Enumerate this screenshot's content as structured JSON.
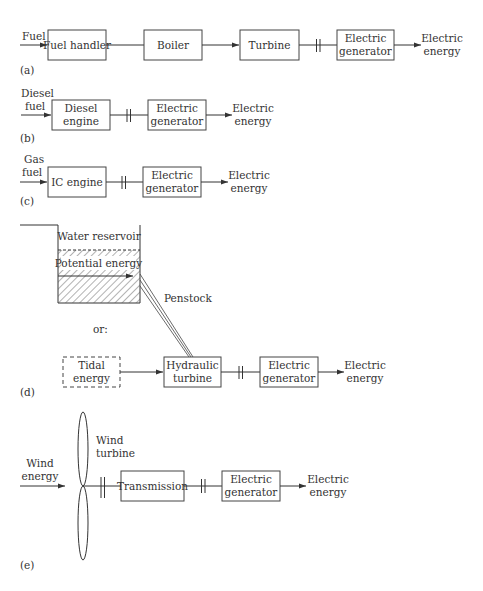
{
  "colors": {
    "stroke": "#444444",
    "text": "#333333",
    "background": "#ffffff"
  },
  "panel_a": {
    "caption": "(a)",
    "input": "Fuel",
    "blocks": [
      "Fuel handler",
      "Boiler",
      "Turbine"
    ],
    "generator": [
      "Electric",
      "generator"
    ],
    "output": [
      "Electric",
      "energy"
    ]
  },
  "panel_b": {
    "caption": "(b)",
    "input": [
      "Diesel",
      "fuel"
    ],
    "engine": [
      "Diesel",
      "engine"
    ],
    "generator": [
      "Electric",
      "generator"
    ],
    "output": [
      "Electric",
      "energy"
    ]
  },
  "panel_c": {
    "caption": "(c)",
    "input": [
      "Gas",
      "fuel"
    ],
    "engine": "IC engine",
    "generator": [
      "Electric",
      "generator"
    ],
    "output": [
      "Electric",
      "energy"
    ]
  },
  "panel_d": {
    "caption": "(d)",
    "reservoir": "Water reservoir",
    "potential": "Potential energy",
    "penstock": "Penstock",
    "or": "or:",
    "tidal": [
      "Tidal",
      "energy"
    ],
    "hydraulic": [
      "Hydraulic",
      "turbine"
    ],
    "generator": [
      "Electric",
      "generator"
    ],
    "output": [
      "Electric",
      "energy"
    ]
  },
  "panel_e": {
    "caption": "(e)",
    "input": [
      "Wind",
      "energy"
    ],
    "turbine": [
      "Wind",
      "turbine"
    ],
    "transmission": "Transmission",
    "generator": [
      "Electric",
      "generator"
    ],
    "output": [
      "Electric",
      "energy"
    ]
  }
}
